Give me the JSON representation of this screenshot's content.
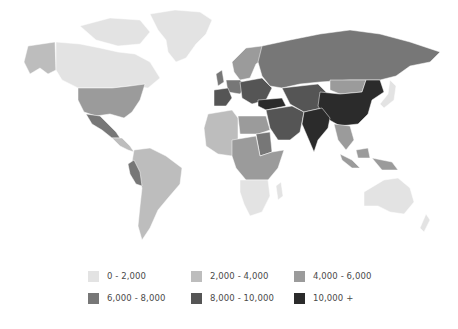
{
  "map": {
    "type": "choropleth-world",
    "region_classes": {
      "north_america_alaska": 1,
      "canada": 0,
      "greenland_arctic": 0,
      "usa": 2,
      "mexico": 3,
      "central_america": 1,
      "south_america": 1,
      "peru": 3,
      "africa_north_west": 1,
      "africa_north_east": 2,
      "egypt_libya": 2,
      "sudan": 3,
      "africa_central_east": 2,
      "africa_south": 0,
      "western_europe": 3,
      "spain_france": 4,
      "central_europe": 4,
      "scandinavia": 2,
      "russia": 3,
      "turkey": 5,
      "middle_east": 4,
      "central_asia": 4,
      "mongolia": 2,
      "china": 5,
      "india": 5,
      "southeast_asia": 2,
      "indonesia": 2,
      "japan_korea": 0,
      "australia": 0,
      "new_zealand": 0
    }
  },
  "legend": {
    "items": [
      {
        "label": "0 - 2,000",
        "color": "#e3e3e3"
      },
      {
        "label": "2,000 - 4,000",
        "color": "#bdbdbd"
      },
      {
        "label": "4,000 - 6,000",
        "color": "#9b9b9b"
      },
      {
        "label": "6,000 - 8,000",
        "color": "#777777"
      },
      {
        "label": "8,000 - 10,000",
        "color": "#555555"
      },
      {
        "label": "10,000 +",
        "color": "#2b2b2b"
      }
    ]
  }
}
